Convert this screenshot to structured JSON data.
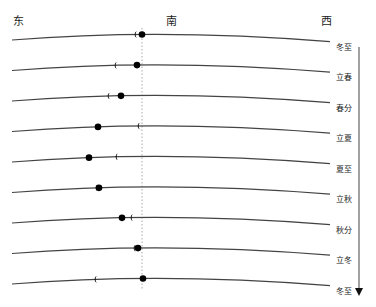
{
  "directions": {
    "east": "东",
    "south": "南",
    "west": "西"
  },
  "rows": [
    {
      "label": "冬至",
      "sun_x": 142,
      "moon_x": 137
    },
    {
      "label": "立春",
      "sun_x": 137,
      "moon_x": 117
    },
    {
      "label": "春分",
      "sun_x": 121,
      "moon_x": 110
    },
    {
      "label": "立夏",
      "sun_x": 98,
      "moon_x": 140
    },
    {
      "label": "夏至",
      "sun_x": 89,
      "moon_x": 118
    },
    {
      "label": "立秋",
      "sun_x": 99,
      "moon_x": 98
    },
    {
      "label": "秋分",
      "sun_x": 122,
      "moon_x": 133
    },
    {
      "label": "立冬",
      "sun_x": 138,
      "moon_x": 136
    },
    {
      "label": "冬至",
      "sun_x": 143,
      "moon_x": 97
    }
  ],
  "colors": {
    "line": "#444444",
    "marker": "#000000",
    "meridian": "#aaaaaa"
  }
}
